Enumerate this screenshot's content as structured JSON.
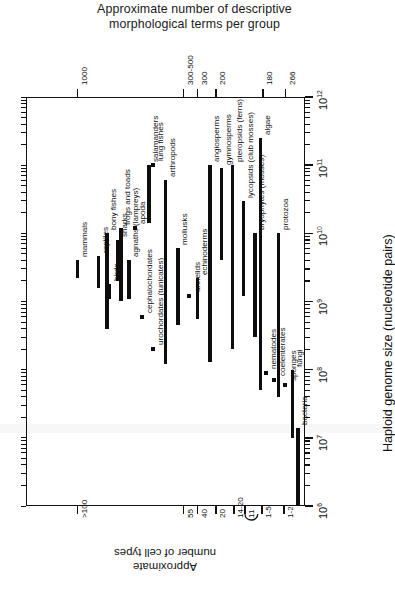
{
  "figure": {
    "title_line1": "Approximate number of descriptive",
    "title_line2": "morphological terms per group",
    "genome_axis_label": "Haploid genome size (nucleotide pairs)",
    "cell_axis_label_line1": "Approximate",
    "cell_axis_label_line2": "number of cell types"
  },
  "chart_data": {
    "type": "bar",
    "orientation": "rotated-90",
    "title": "Approximate number of descriptive morphological terms per group",
    "xlabel": "Haploid genome size (nucleotide pairs)",
    "ylabel": "Approximate number of cell types",
    "value_axis": {
      "name": "Haploid genome size (nucleotide pairs)",
      "scale": "log10",
      "min": 1000000,
      "max": 1000000000000,
      "tick_labels": [
        "10⁶",
        "10⁷",
        "10⁸",
        "10⁹",
        "10¹⁰",
        "10¹¹",
        "10¹²"
      ],
      "tick_exponents": [
        6,
        7,
        8,
        9,
        10,
        11,
        12
      ],
      "minor_ticks": true
    },
    "top_axis": {
      "name": "Approximate number of descriptive morphological terms per group",
      "tick_labels": [
        "1000",
        "300-500",
        "300",
        "200",
        "180",
        "266"
      ],
      "tick_positions_pct": [
        18.5,
        56.5,
        61.5,
        68.0,
        85.0,
        93.0
      ]
    },
    "bottom_axis": {
      "name": "Approximate number of cell types",
      "tick_labels": [
        ">100",
        "55",
        "40",
        "20",
        "14-20",
        "11",
        "1-5",
        "1-2"
      ],
      "tick_positions_pct": [
        18.5,
        56.5,
        61.5,
        68.0,
        74.5,
        78.5,
        84.5,
        92.5
      ]
    },
    "groups": [
      {
        "label": "mammals",
        "pos_pct": 18.5,
        "min": 2200000000.0,
        "max": 4000000000.0,
        "marker": "bar"
      },
      {
        "label": "birds",
        "pos_pct": 30.0,
        "min": 1100000000.0,
        "max": 1800000000.0,
        "marker": "bar"
      },
      {
        "label": "reptiles",
        "pos_pct": 26.0,
        "min": 1600000000.0,
        "max": 4600000000.0,
        "marker": "bar"
      },
      {
        "label": "frogs and toads",
        "pos_pct": 34.0,
        "min": 1000000000.0,
        "max": 12000000000.0,
        "marker": "bar"
      },
      {
        "label": "salamanders",
        "pos_pct": 44.0,
        "min": 14000000000.0,
        "max": 100000000000.0,
        "marker": "bar"
      },
      {
        "label": "apoda",
        "pos_pct": 39.0,
        "min": 12000000000.0,
        "max": 12000000000.0,
        "marker": "square"
      },
      {
        "label": "lung fishes",
        "pos_pct": 45.5,
        "min": 100000000000.0,
        "max": 100000000000.0,
        "marker": "square"
      },
      {
        "label": "bony fishes",
        "pos_pct": 29.0,
        "min": 400000000.0,
        "max": 10000000000.0,
        "marker": "bar"
      },
      {
        "label": "sharks",
        "pos_pct": 33.0,
        "min": 2000000000.0,
        "max": 8000000000.0,
        "marker": "bar"
      },
      {
        "label": "agnaths (lampreys)",
        "pos_pct": 37.0,
        "min": 1100000000.0,
        "max": 4000000000.0,
        "marker": "bar"
      },
      {
        "label": "cephalochordates",
        "pos_pct": 41.5,
        "min": 600000000.0,
        "max": 600000000.0,
        "marker": "square"
      },
      {
        "label": "urochordates (tunicates)",
        "pos_pct": 45.5,
        "min": 200000000.0,
        "max": 200000000.0,
        "marker": "square"
      },
      {
        "label": "arthropods",
        "pos_pct": 50.0,
        "min": 120000000.0,
        "max": 60000000000.0,
        "marker": "bar"
      },
      {
        "label": "mollusks",
        "pos_pct": 54.5,
        "min": 450000000.0,
        "max": 6000000000.0,
        "marker": "bar"
      },
      {
        "label": "annelids",
        "pos_pct": 58.5,
        "min": 1200000000.0,
        "max": 1200000000.0,
        "marker": "square"
      },
      {
        "label": "echinoderms",
        "pos_pct": 61.5,
        "min": 550000000.0,
        "max": 2200000000.0,
        "marker": "bar"
      },
      {
        "label": "angiosperms",
        "pos_pct": 66.0,
        "min": 130000000.0,
        "max": 100000000000.0,
        "marker": "bar"
      },
      {
        "label": "gymnosperms",
        "pos_pct": 70.0,
        "min": 4000000000.0,
        "max": 90000000000.0,
        "marker": "bar"
      },
      {
        "label": "pteropsids (ferns)",
        "pos_pct": 74.0,
        "min": 200000000.0,
        "max": 100000000000.0,
        "marker": "bar"
      },
      {
        "label": "lycopsids (club mosses)",
        "pos_pct": 78.0,
        "min": 1200000000.0,
        "max": 30000000000.0,
        "marker": "bar"
      },
      {
        "label": "bryophytes (mosses)",
        "pos_pct": 82.0,
        "min": 300000000.0,
        "max": 10000000000.0,
        "marker": "bar"
      },
      {
        "label": "nematodes",
        "pos_pct": 86.0,
        "min": 90000000.0,
        "max": 90000000.0,
        "marker": "square"
      },
      {
        "label": "coelenterates",
        "pos_pct": 89.0,
        "min": 70000000.0,
        "max": 70000000.0,
        "marker": "square"
      },
      {
        "label": "sponges",
        "pos_pct": 93.0,
        "min": 60000000.0,
        "max": 60000000.0,
        "marker": "square"
      },
      {
        "label": "algae",
        "pos_pct": 84.0,
        "min": 50000000.0,
        "max": 250000000000.0,
        "marker": "bar"
      },
      {
        "label": "protozoa",
        "pos_pct": 90.5,
        "min": 40000000.0,
        "max": 10000000000.0,
        "marker": "bar"
      },
      {
        "label": "fungi",
        "pos_pct": 95.5,
        "min": 10000000.0,
        "max": 100000000.0,
        "marker": "bar"
      },
      {
        "label": "bacteria",
        "pos_pct": 97.5,
        "min": 1000000.0,
        "max": 14000000.0,
        "marker": "bar"
      }
    ]
  }
}
